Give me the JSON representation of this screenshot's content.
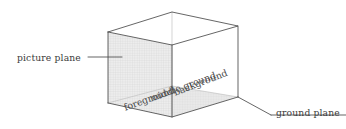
{
  "figure": {
    "background_color": "#ffffff",
    "line_color": "#4a4a4a",
    "light_line_color": "#b9b9b9",
    "text_color": "#3b3b3b",
    "picture_plane_fill": "#e8e8e8",
    "ground_plane_fill": "#e2e2e2"
  },
  "labels": {
    "picture_plane": "picture plane",
    "ground_plane": "ground plane",
    "background": "background",
    "middle_ground": "middle ground",
    "foreground": "foreground"
  },
  "geometry": {
    "box_vertices": {
      "top_left": [
        108,
        32
      ],
      "top_back": [
        172,
        12
      ],
      "top_right": [
        238,
        26
      ],
      "top_front": [
        172,
        45
      ],
      "bottom_left": [
        108,
        103
      ],
      "bottom_front": [
        172,
        117
      ],
      "bottom_right": [
        238,
        97
      ]
    },
    "picture_plane_face": [
      [
        108,
        32
      ],
      [
        172,
        45
      ],
      [
        172,
        117
      ],
      [
        108,
        103
      ]
    ],
    "ground_plane_face": [
      [
        108,
        103
      ],
      [
        172,
        117
      ],
      [
        238,
        97
      ],
      [
        172,
        86
      ]
    ],
    "leader_picture_plane": [
      [
        88,
        57
      ],
      [
        122,
        57
      ]
    ],
    "leader_ground_plane": [
      [
        238,
        97
      ],
      [
        271,
        115
      ],
      [
        346,
        115
      ]
    ]
  }
}
